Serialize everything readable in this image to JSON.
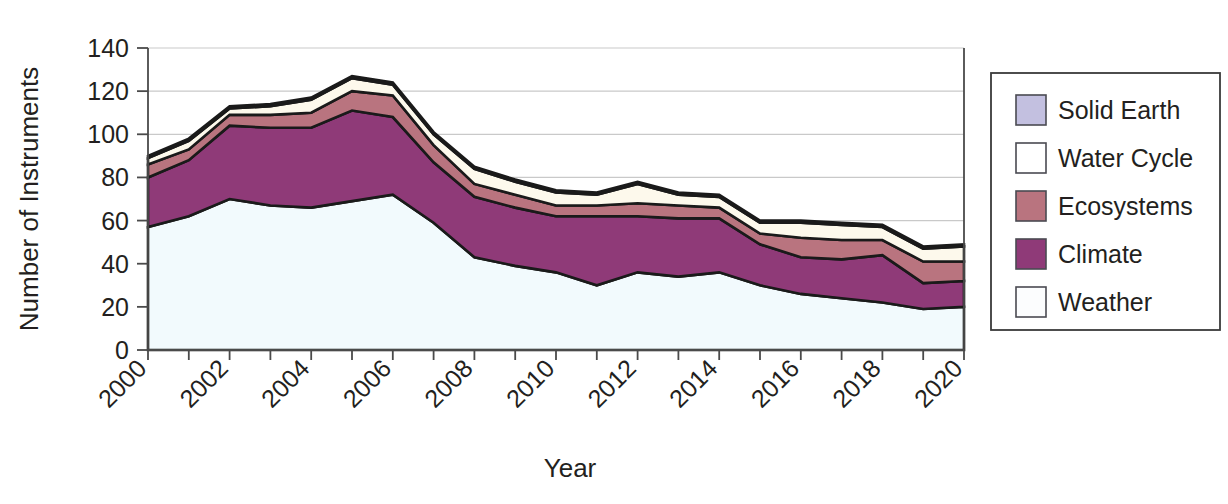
{
  "chart_data": {
    "type": "area",
    "title": "",
    "xlabel": "Year",
    "ylabel": "Number of Instruments",
    "stacked": true,
    "grid": true,
    "legend_position": "right",
    "xlim": [
      2000,
      2020
    ],
    "ylim": [
      0,
      140
    ],
    "y_ticks": [
      0,
      20,
      40,
      60,
      80,
      100,
      120,
      140
    ],
    "x_ticks": [
      2000,
      2001,
      2002,
      2003,
      2004,
      2005,
      2006,
      2007,
      2008,
      2009,
      2010,
      2011,
      2012,
      2013,
      2014,
      2015,
      2016,
      2017,
      2018,
      2019,
      2020
    ],
    "x_tick_labels": [
      "2000",
      "",
      "2002",
      "",
      "2004",
      "",
      "2006",
      "",
      "2008",
      "",
      "2010",
      "",
      "2012",
      "",
      "2014",
      "",
      "2016",
      "",
      "2018",
      "",
      "2020"
    ],
    "categories": [
      2000,
      2001,
      2002,
      2003,
      2004,
      2005,
      2006,
      2007,
      2008,
      2009,
      2010,
      2011,
      2012,
      2013,
      2014,
      2015,
      2016,
      2017,
      2018,
      2019,
      2020
    ],
    "series": [
      {
        "name": "Weather",
        "color": "#F2FAFD",
        "values": [
          57,
          62,
          70,
          67,
          66,
          69,
          72,
          59,
          43,
          39,
          36,
          30,
          36,
          34,
          36,
          30,
          26,
          24,
          22,
          19,
          20
        ]
      },
      {
        "name": "Climate",
        "color": "#8F3A78",
        "values": [
          23,
          26,
          34,
          36,
          37,
          42,
          36,
          28,
          28,
          27,
          26,
          32,
          26,
          27,
          25,
          19,
          17,
          18,
          22,
          12,
          12
        ]
      },
      {
        "name": "Ecosystems",
        "color": "#B9747F",
        "values": [
          6,
          5,
          5,
          6,
          7,
          9,
          10,
          8,
          6,
          6,
          5,
          5,
          6,
          6,
          5,
          5,
          9,
          9,
          7,
          10,
          9
        ]
      },
      {
        "name": "Water Cycle",
        "color": "#FDF9EC",
        "values": [
          3,
          4,
          3,
          4,
          6,
          6,
          5,
          5,
          7,
          6,
          6,
          5,
          9,
          5,
          5,
          5,
          7,
          7,
          6,
          6,
          7
        ]
      },
      {
        "name": "Solid Earth",
        "color": "#C3C0E0",
        "values": [
          1,
          1,
          1,
          1,
          1,
          1,
          1,
          1,
          1,
          1,
          1,
          1,
          1,
          1,
          1,
          1,
          1,
          1,
          1,
          1,
          1
        ]
      }
    ],
    "totals": [
      90,
      98,
      113,
      114,
      117,
      127,
      124,
      101,
      85,
      79,
      74,
      73,
      78,
      73,
      72,
      60,
      60,
      59,
      58,
      48,
      49
    ]
  },
  "legend": {
    "entries": [
      {
        "label": "Solid Earth",
        "color": "#C3C0E0"
      },
      {
        "label": "Water Cycle",
        "color": "#FFFFFF"
      },
      {
        "label": "Ecosystems",
        "color": "#B9747F"
      },
      {
        "label": "Climate",
        "color": "#8F3A78"
      },
      {
        "label": "Weather",
        "color": "#FCFDFE"
      }
    ]
  },
  "axes": {
    "y_title": "Number of Instruments",
    "x_title": "Year",
    "y_tick_labels": [
      "140",
      "120",
      "100",
      "80",
      "60",
      "40",
      "20",
      "0"
    ],
    "x_tick_labels": [
      "2000",
      "2002",
      "2004",
      "2006",
      "2008",
      "2010",
      "2012",
      "2014",
      "2016",
      "2018",
      "2020"
    ]
  }
}
